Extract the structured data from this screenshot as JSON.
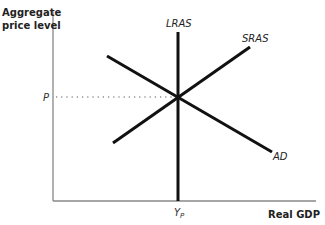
{
  "diagram": {
    "type": "AD-AS model (long-run macroeconomic equilibrium)",
    "y_axis": {
      "label_line1": "Aggregate",
      "label_line2": "price level"
    },
    "x_axis": {
      "label": "Real GDP"
    },
    "curves": {
      "lras": {
        "label": "LRAS",
        "description": "vertical long-run aggregate supply at potential output"
      },
      "sras": {
        "label": "SRAS",
        "description": "upward-sloping short-run aggregate supply"
      },
      "ad": {
        "label": "AD",
        "description": "downward-sloping aggregate demand"
      }
    },
    "equilibrium": {
      "price_label": "P",
      "output_label_base": "Y",
      "output_label_sub": "P"
    },
    "colors": {
      "curves": "#111111",
      "axes": "#777777",
      "guide": "#555555"
    }
  }
}
